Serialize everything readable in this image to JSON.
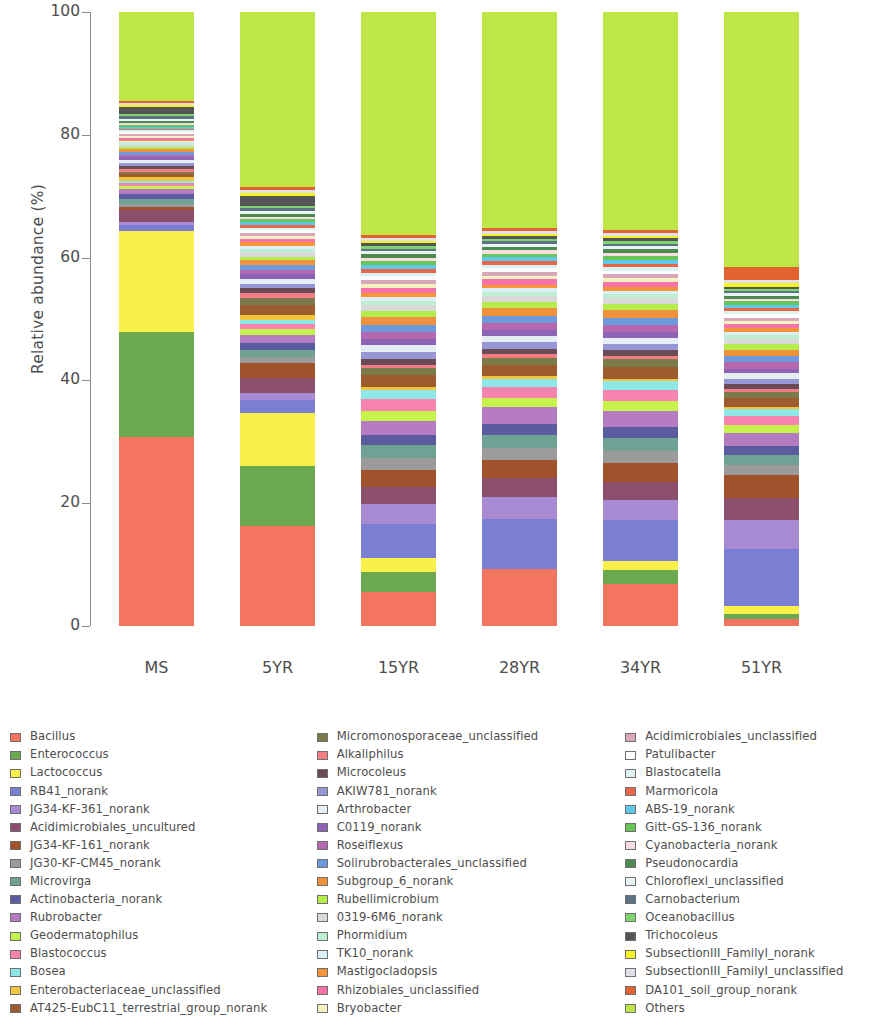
{
  "chart_data": {
    "type": "bar",
    "subtype": "stacked-bar-100-percent",
    "title": "",
    "xlabel": "",
    "ylabel": "Relative abundance (%)",
    "ylim": [
      0,
      100
    ],
    "yticks": [
      0,
      20,
      40,
      60,
      80,
      100
    ],
    "grid": false,
    "legend_position": "bottom",
    "legend_columns": 3,
    "categories": [
      "MS",
      "5YR",
      "15YR",
      "28YR",
      "34YR",
      "51YR"
    ],
    "series": [
      {
        "name": "Bacillus",
        "color": "#F4755F",
        "values": [
          31.0,
          14.6,
          5.1,
          8.8,
          6.5,
          1.0
        ]
      },
      {
        "name": "Enterococcus",
        "color": "#6BA84F",
        "values": [
          17.3,
          8.6,
          3.0,
          0.0,
          2.2,
          0.8
        ]
      },
      {
        "name": "Lactococcus",
        "color": "#F9F04A",
        "values": [
          16.5,
          7.7,
          2.2,
          0.0,
          1.4,
          1.1
        ]
      },
      {
        "name": "RB41_norank",
        "color": "#7B7FD4",
        "values": [
          0.9,
          1.9,
          5.0,
          7.8,
          6.4,
          8.4
        ]
      },
      {
        "name": "JG34-KF-361_norank",
        "color": "#A98BD4",
        "values": [
          0.6,
          1.1,
          3.0,
          3.4,
          3.1,
          4.2
        ]
      },
      {
        "name": "Acidimicrobiales_uncultured",
        "color": "#8C4F6B",
        "values": [
          2.0,
          2.1,
          2.6,
          2.9,
          2.8,
          3.3
        ]
      },
      {
        "name": "JG34-KF-161_norank",
        "color": "#A0522D",
        "values": [
          0.5,
          2.2,
          2.6,
          2.8,
          2.9,
          3.4
        ]
      },
      {
        "name": "JG30-KF-CM45_norank",
        "color": "#9B9B9B",
        "values": [
          0.4,
          0.9,
          1.8,
          1.8,
          1.8,
          1.5
        ]
      },
      {
        "name": "Microvirga",
        "color": "#6FA195",
        "values": [
          0.9,
          1.0,
          1.9,
          2.0,
          2.1,
          1.4
        ]
      },
      {
        "name": "Actinobacteria_norank",
        "color": "#5B5BA0",
        "values": [
          0.8,
          1.0,
          1.6,
          1.7,
          1.7,
          1.3
        ]
      },
      {
        "name": "Rubrobacter",
        "color": "#B57CC2",
        "values": [
          0.7,
          1.2,
          2.1,
          2.6,
          2.5,
          2.0
        ]
      },
      {
        "name": "Geodermatophilus",
        "color": "#C5F24B",
        "values": [
          0.5,
          0.8,
          1.5,
          1.5,
          1.5,
          1.1
        ]
      },
      {
        "name": "Blastococcus",
        "color": "#F784AE",
        "values": [
          0.5,
          0.8,
          1.7,
          1.6,
          1.7,
          1.3
        ]
      },
      {
        "name": "Bosea",
        "color": "#8FE8E8",
        "values": [
          0.4,
          0.6,
          1.4,
          1.3,
          1.4,
          1.0
        ]
      },
      {
        "name": "Enterobacteriaceae_unclassified",
        "color": "#F2C63C",
        "values": [
          0.6,
          0.7,
          0.5,
          0.4,
          0.4,
          0.3
        ]
      },
      {
        "name": "AT425-EubC11_terrestrial_group_norank",
        "color": "#9C5C2E",
        "values": [
          0.5,
          1.5,
          1.7,
          1.8,
          1.8,
          1.4
        ]
      },
      {
        "name": "Micromonosporaceae_unclassified",
        "color": "#7A7A4B",
        "values": [
          0.4,
          0.9,
          1.1,
          1.1,
          1.2,
          0.9
        ]
      },
      {
        "name": "Alkaliphilus",
        "color": "#F27E83",
        "values": [
          0.5,
          0.8,
          0.5,
          0.5,
          0.5,
          0.4
        ]
      },
      {
        "name": "Microcoleus",
        "color": "#6B4B55",
        "values": [
          0.5,
          0.7,
          0.9,
          0.9,
          0.9,
          0.7
        ]
      },
      {
        "name": "AKIW781_norank",
        "color": "#9797D6",
        "values": [
          0.4,
          0.6,
          1.0,
          1.0,
          1.0,
          0.8
        ]
      },
      {
        "name": "Arthrobacter",
        "color": "#E4EEF4",
        "values": [
          0.6,
          0.8,
          1.0,
          1.0,
          1.0,
          0.8
        ]
      },
      {
        "name": "C0119_norank",
        "color": "#8C63B5",
        "values": [
          0.4,
          0.7,
          0.9,
          0.9,
          0.9,
          0.7
        ]
      },
      {
        "name": "Roseiflexus",
        "color": "#B567B0",
        "values": [
          0.4,
          0.6,
          1.1,
          1.1,
          1.1,
          0.9
        ]
      },
      {
        "name": "Solirubrobacterales_unclassified",
        "color": "#6E9ADB",
        "values": [
          0.4,
          0.6,
          1.1,
          1.1,
          1.1,
          0.9
        ]
      },
      {
        "name": "Subgroup_6_norank",
        "color": "#F0913C",
        "values": [
          0.5,
          0.8,
          1.2,
          1.2,
          1.2,
          1.0
        ]
      },
      {
        "name": "Rubellimicrobium",
        "color": "#B5EC4B",
        "values": [
          0.3,
          0.5,
          0.9,
          0.9,
          0.9,
          0.8
        ]
      },
      {
        "name": "0319-6M6_norank",
        "color": "#D9D9D9",
        "values": [
          0.4,
          0.6,
          0.9,
          0.9,
          0.9,
          0.8
        ]
      },
      {
        "name": "Phormidium",
        "color": "#BFEFD3",
        "values": [
          0.3,
          0.5,
          0.6,
          0.6,
          0.6,
          0.5
        ]
      },
      {
        "name": "TK10_norank",
        "color": "#DCEEF7",
        "values": [
          0.3,
          0.5,
          0.6,
          0.6,
          0.6,
          0.5
        ]
      },
      {
        "name": "Mastigocladopsis",
        "color": "#F59438",
        "values": [
          0.3,
          0.5,
          0.6,
          0.6,
          0.6,
          0.5
        ]
      },
      {
        "name": "Rhizobiales_unclassified",
        "color": "#F573A8",
        "values": [
          0.3,
          0.5,
          0.8,
          0.8,
          0.8,
          0.7
        ]
      },
      {
        "name": "Bryobacter",
        "color": "#F4F3C0",
        "values": [
          0.3,
          0.4,
          0.5,
          0.5,
          0.5,
          0.4
        ]
      },
      {
        "name": "Acidimicrobiales_unclassified",
        "color": "#D9A8B8",
        "values": [
          0.3,
          0.4,
          0.6,
          0.6,
          0.6,
          0.5
        ]
      },
      {
        "name": "Patulibacter",
        "color": "#FFFFFF",
        "values": [
          0.3,
          0.4,
          0.6,
          0.6,
          0.6,
          0.5
        ]
      },
      {
        "name": "Blastocatella",
        "color": "#DDF3F1",
        "values": [
          0.3,
          0.4,
          0.5,
          0.5,
          0.5,
          0.4
        ]
      },
      {
        "name": "Marmoricola",
        "color": "#E8674A",
        "values": [
          0.3,
          0.4,
          0.6,
          0.6,
          0.6,
          0.5
        ]
      },
      {
        "name": "ABS-19_norank",
        "color": "#5FC8EA",
        "values": [
          0.3,
          0.4,
          0.6,
          0.6,
          0.6,
          0.5
        ]
      },
      {
        "name": "Gitt-GS-136_norank",
        "color": "#69C45A",
        "values": [
          0.3,
          0.4,
          0.6,
          0.6,
          0.6,
          0.5
        ]
      },
      {
        "name": "Cyanobacteria_norank",
        "color": "#F7DCE2",
        "values": [
          0.3,
          0.4,
          0.5,
          0.5,
          0.5,
          0.4
        ]
      },
      {
        "name": "Pseudonocardia",
        "color": "#4D8A4D",
        "values": [
          0.3,
          0.4,
          0.5,
          0.5,
          0.5,
          0.4
        ]
      },
      {
        "name": "Chloroflexi_unclassified",
        "color": "#E7F3F7",
        "values": [
          0.3,
          0.4,
          0.5,
          0.5,
          0.5,
          0.4
        ]
      },
      {
        "name": "Carnobacterium",
        "color": "#5D7282",
        "values": [
          0.5,
          0.4,
          0.4,
          0.4,
          0.4,
          0.3
        ]
      },
      {
        "name": "Oceanobacillus",
        "color": "#7FD46F",
        "values": [
          0.4,
          0.4,
          0.4,
          0.4,
          0.4,
          0.3
        ]
      },
      {
        "name": "Trichocoleus",
        "color": "#555555",
        "values": [
          1.2,
          1.4,
          0.4,
          0.4,
          0.4,
          0.3
        ]
      },
      {
        "name": "SubsectionIII_FamilyI_norank",
        "color": "#F3F223",
        "values": [
          0.3,
          0.5,
          0.4,
          0.4,
          0.4,
          0.6
        ]
      },
      {
        "name": "SubsectionIII_FamilyI_unclassified",
        "color": "#E2DFEA",
        "values": [
          0.3,
          0.4,
          0.4,
          0.4,
          0.4,
          0.4
        ]
      },
      {
        "name": "DA101_soil_group_norank",
        "color": "#E2632F",
        "values": [
          0.3,
          0.4,
          0.5,
          0.5,
          0.5,
          1.9
        ]
      },
      {
        "name": "Others",
        "color": "#BEE647",
        "values": [
          14.6,
          25.4,
          33.4,
          33.3,
          33.8,
          37.4
        ]
      }
    ]
  },
  "axes": {
    "y_label": "Relative abundance (%)",
    "y_ticks": [
      "0",
      "20",
      "40",
      "60",
      "80",
      "100"
    ],
    "x_ticks": [
      "MS",
      "5YR",
      "15YR",
      "28YR",
      "34YR",
      "51YR"
    ]
  },
  "legend": {
    "columns": [
      {
        "items": [
          {
            "label": "Bacillus",
            "color": "#F4755F"
          },
          {
            "label": "Enterococcus",
            "color": "#6BA84F"
          },
          {
            "label": "Lactococcus",
            "color": "#F9F04A"
          },
          {
            "label": "RB41_norank",
            "color": "#7B7FD4"
          },
          {
            "label": "JG34-KF-361_norank",
            "color": "#A98BD4"
          },
          {
            "label": "Acidimicrobiales_uncultured",
            "color": "#8C4F6B"
          },
          {
            "label": "JG34-KF-161_norank",
            "color": "#A0522D"
          },
          {
            "label": "JG30-KF-CM45_norank",
            "color": "#9B9B9B"
          },
          {
            "label": "Microvirga",
            "color": "#6FA195"
          },
          {
            "label": "Actinobacteria_norank",
            "color": "#5B5BA0"
          },
          {
            "label": "Rubrobacter",
            "color": "#B57CC2"
          },
          {
            "label": "Geodermatophilus",
            "color": "#C5F24B"
          },
          {
            "label": "Blastococcus",
            "color": "#F784AE"
          },
          {
            "label": "Bosea",
            "color": "#8FE8E8"
          },
          {
            "label": "Enterobacteriaceae_unclassified",
            "color": "#F2C63C"
          },
          {
            "label": "AT425-EubC11_terrestrial_group_norank",
            "color": "#9C5C2E"
          }
        ]
      },
      {
        "items": [
          {
            "label": "Micromonosporaceae_unclassified",
            "color": "#7A7A4B"
          },
          {
            "label": "Alkaliphilus",
            "color": "#F27E83"
          },
          {
            "label": "Microcoleus",
            "color": "#6B4B55"
          },
          {
            "label": "AKIW781_norank",
            "color": "#9797D6"
          },
          {
            "label": "Arthrobacter",
            "color": "#E4EEF4"
          },
          {
            "label": "C0119_norank",
            "color": "#8C63B5"
          },
          {
            "label": "Roseiflexus",
            "color": "#B567B0"
          },
          {
            "label": "Solirubrobacterales_unclassified",
            "color": "#6E9ADB"
          },
          {
            "label": "Subgroup_6_norank",
            "color": "#F0913C"
          },
          {
            "label": "Rubellimicrobium",
            "color": "#B5EC4B"
          },
          {
            "label": "0319-6M6_norank",
            "color": "#D9D9D9"
          },
          {
            "label": "Phormidium",
            "color": "#BFEFD3"
          },
          {
            "label": "TK10_norank",
            "color": "#DCEEF7"
          },
          {
            "label": "Mastigocladopsis",
            "color": "#F59438"
          },
          {
            "label": "Rhizobiales_unclassified",
            "color": "#F573A8"
          },
          {
            "label": "Bryobacter",
            "color": "#F4F3C0"
          }
        ]
      },
      {
        "items": [
          {
            "label": "Acidimicrobiales_unclassified",
            "color": "#D9A8B8"
          },
          {
            "label": "Patulibacter",
            "color": "#FFFFFF"
          },
          {
            "label": "Blastocatella",
            "color": "#DDF3F1"
          },
          {
            "label": "Marmoricola",
            "color": "#E8674A"
          },
          {
            "label": "ABS-19_norank",
            "color": "#5FC8EA"
          },
          {
            "label": "Gitt-GS-136_norank",
            "color": "#69C45A"
          },
          {
            "label": "Cyanobacteria_norank",
            "color": "#F7DCE2"
          },
          {
            "label": "Pseudonocardia",
            "color": "#4D8A4D"
          },
          {
            "label": "Chloroflexi_unclassified",
            "color": "#E7F3F7"
          },
          {
            "label": "Carnobacterium",
            "color": "#5D7282"
          },
          {
            "label": "Oceanobacillus",
            "color": "#7FD46F"
          },
          {
            "label": "Trichocoleus",
            "color": "#555555"
          },
          {
            "label": "SubsectionIII_FamilyI_norank",
            "color": "#F3F223"
          },
          {
            "label": "SubsectionIII_FamilyI_unclassified",
            "color": "#E2DFEA"
          },
          {
            "label": "DA101_soil_group_norank",
            "color": "#E2632F"
          },
          {
            "label": "Others",
            "color": "#BEE647"
          }
        ]
      }
    ]
  }
}
